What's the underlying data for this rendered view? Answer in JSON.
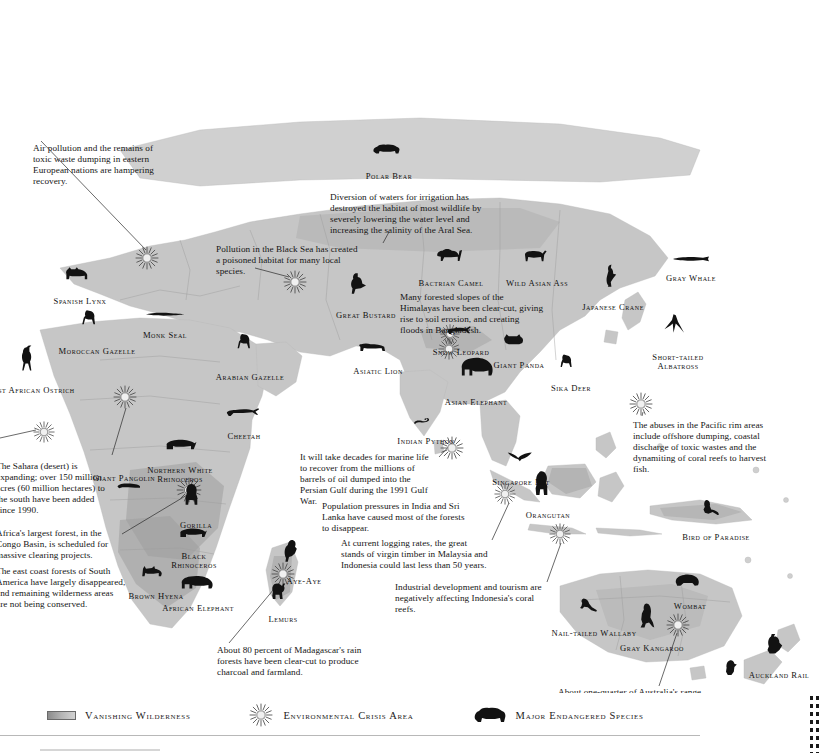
{
  "legend": {
    "items": [
      {
        "id": "vanishing-wilderness",
        "label": "Vanishing  Wilderness",
        "icon": "gradient-band-swatch"
      },
      {
        "id": "environmental-crisis-area",
        "label": "Environmental Crisis Area",
        "icon": "sunburst-icon"
      },
      {
        "id": "major-endangered-species",
        "label": "Major Endangered Species",
        "icon": "bear-silhouette-icon"
      }
    ]
  },
  "colors": {
    "land": "#c9c9c9",
    "land_dark": "#a8a8a8",
    "wilderness_shade": "#9a9a9a",
    "ocean": "#ffffff",
    "ink": "#111111",
    "border_line": "#b0b0b0"
  },
  "annotations": [
    {
      "id": "eastern-europe-pollution",
      "text": "Air pollution and the remains of toxic waste dumping in eastern European nations are hampering recovery.",
      "x": 33,
      "y": 143,
      "w": 140
    },
    {
      "id": "aral-sea",
      "text": "Diversion of waters for irrigation has destroyed the habitat of most wildlife by severely lowering the water level and increasing the salinity of the Aral Sea.",
      "x": 330,
      "y": 192,
      "w": 152
    },
    {
      "id": "black-sea",
      "text": "Pollution in the Black Sea has created a poisoned habitat for many local species.",
      "x": 216,
      "y": 244,
      "w": 148
    },
    {
      "id": "himalayas",
      "text": "Many forested slopes of the Himalayas have been clear-cut, giving rise to soil erosion, and creating floods in Bangladesh.",
      "x": 400,
      "y": 292,
      "w": 145
    },
    {
      "id": "sahara-expansion",
      "text": "The Sahara (desert) is expanding; over 150 million acres (60 million hectares) to the south have been added since 1990.",
      "x": -4,
      "y": 461,
      "w": 118
    },
    {
      "id": "congo-basin",
      "text": "Africa's largest forest, in the Congo Basin, is scheduled for massive clearing projects.",
      "x": -4,
      "y": 528,
      "w": 125
    },
    {
      "id": "south-america-east-coast",
      "text": "The east coast forests of South America have largely disappeared, and remaining wilderness areas are not being conserved.",
      "x": -4,
      "y": 566,
      "w": 130
    },
    {
      "id": "persian-gulf-oil",
      "text": "It will take decades for marine life to recover from the millions of barrels of oil dumped into the Persian Gulf during the 1991 Gulf War.",
      "x": 300,
      "y": 452,
      "w": 138
    },
    {
      "id": "india-sri-lanka",
      "text": "Population pressures in India and Sri Lanka have caused most of the forests to disappear.",
      "x": 322,
      "y": 501,
      "w": 146
    },
    {
      "id": "malaysia-indonesia-timber",
      "text": "At current logging rates, the great stands of virgin timber in Malaysia and Indonesia could last less than 50 years.",
      "x": 341,
      "y": 538,
      "w": 150
    },
    {
      "id": "indonesia-coral-reefs",
      "text": "Industrial development and tourism are negatively affecting Indonesia's coral reefs.",
      "x": 395,
      "y": 582,
      "w": 152
    },
    {
      "id": "pacific-rim-abuses",
      "text": "The abuses in the Pacific rim areas include offshore dumping, coastal discharge of toxic wastes and the dynamiting of coral reefs to harvest fish.",
      "x": 633,
      "y": 420,
      "w": 144
    },
    {
      "id": "madagascar-rainforest",
      "text": "About 80 percent of Madagascar's rain forests have been clear-cut to produce charcoal and farmland.",
      "x": 217,
      "y": 645,
      "w": 152
    },
    {
      "id": "australia-desertification",
      "text": "About one-quarter of Australia's range and cropland has become irreversible desert.",
      "x": 558,
      "y": 687,
      "w": 150
    }
  ],
  "species": [
    {
      "id": "polar-bear",
      "label": "Polar Bear",
      "icon": "bear-icon",
      "lx": 389,
      "ly": 172,
      "ax": 389,
      "ay": 152,
      "aw": 34,
      "ah": 17
    },
    {
      "id": "spanish-lynx",
      "label": "Spanish Lynx",
      "icon": "lynx-icon",
      "lx": 80,
      "ly": 297,
      "ax": 80,
      "ay": 276,
      "aw": 32,
      "ah": 19
    },
    {
      "id": "moroccan-gazelle",
      "label": "Moroccan Gazelle",
      "icon": "gazelle-icon",
      "lx": 97,
      "ly": 347,
      "ax": 92,
      "ay": 320,
      "aw": 30,
      "ah": 25
    },
    {
      "id": "monk-seal",
      "label": "Monk Seal",
      "icon": "seal-icon",
      "lx": 165,
      "ly": 331,
      "ax": 165,
      "ay": 317,
      "aw": 40,
      "ah": 11
    },
    {
      "id": "west-african-ostrich",
      "label": "West African Ostrich",
      "icon": "ostrich-icon",
      "lx": 30,
      "ly": 386,
      "ax": 32,
      "ay": 358,
      "aw": 26,
      "ah": 27
    },
    {
      "id": "arabian-gazelle",
      "label": "Arabian Gazelle",
      "icon": "gazelle-icon",
      "lx": 250,
      "ly": 373,
      "ax": 247,
      "ay": 344,
      "aw": 29,
      "ah": 26
    },
    {
      "id": "great-bustard",
      "label": "Great Bustard",
      "icon": "bustard-icon",
      "lx": 366,
      "ly": 311,
      "ax": 363,
      "ay": 284,
      "aw": 30,
      "ah": 25
    },
    {
      "id": "bactrian-camel",
      "label": "Bactrian Camel",
      "icon": "camel-icon",
      "lx": 451,
      "ly": 279,
      "ax": 451,
      "ay": 257,
      "aw": 34,
      "ah": 20
    },
    {
      "id": "wild-asian-ass",
      "label": "Wild Asian Ass",
      "icon": "ass-icon",
      "lx": 537,
      "ly": 279,
      "ax": 537,
      "ay": 258,
      "aw": 32,
      "ah": 19
    },
    {
      "id": "japanese-crane",
      "label": "Japanese Crane",
      "icon": "crane-icon",
      "lx": 613,
      "ly": 303,
      "ax": 615,
      "ay": 276,
      "aw": 24,
      "ah": 25
    },
    {
      "id": "gray-whale",
      "label": "Gray Whale",
      "icon": "whale-icon",
      "lx": 691,
      "ly": 274,
      "ax": 691,
      "ay": 262,
      "aw": 40,
      "ah": 12
    },
    {
      "id": "short-tailed-albatross",
      "label": "Short-tailed Albatross",
      "icon": "albatross-icon",
      "lx": 678,
      "ly": 353,
      "ax": 678,
      "ay": 325,
      "aw": 30,
      "ah": 25,
      "two_line": true
    },
    {
      "id": "asiatic-lion",
      "label": "Asiatic Lion",
      "icon": "lion-icon",
      "lx": 378,
      "ly": 367,
      "ax": 374,
      "ay": 350,
      "aw": 34,
      "ah": 16
    },
    {
      "id": "snow-leopard",
      "label": "Snow Leopard",
      "icon": "leopard-icon",
      "lx": 461,
      "ly": 348,
      "ax": 462,
      "ay": 333,
      "aw": 32,
      "ah": 16,
      "two_line": true
    },
    {
      "id": "giant-panda",
      "label": "Giant Panda",
      "icon": "panda-icon",
      "lx": 519,
      "ly": 361,
      "ax": 517,
      "ay": 342,
      "aw": 30,
      "ah": 18
    },
    {
      "id": "sika-deer",
      "label": "Sika Deer",
      "icon": "deer-icon",
      "lx": 571,
      "ly": 384,
      "ax": 571,
      "ay": 362,
      "aw": 26,
      "ah": 21
    },
    {
      "id": "asian-elephant",
      "label": "Asian Elephant",
      "icon": "elephant-icon",
      "lx": 476,
      "ly": 398,
      "ax": 478,
      "ay": 369,
      "aw": 38,
      "ah": 27
    },
    {
      "id": "indian-python",
      "label": "Indian Python",
      "icon": "python-icon",
      "lx": 426,
      "ly": 437,
      "ax": 426,
      "ay": 424,
      "aw": 26,
      "ah": 13
    },
    {
      "id": "cheetah",
      "label": "Cheetah",
      "icon": "cheetah-icon",
      "lx": 244,
      "ly": 432,
      "ax": 243,
      "ay": 415,
      "aw": 38,
      "ah": 16
    },
    {
      "id": "giant-pangolin",
      "label": "Giant Pangolin",
      "icon": "pangolin-icon",
      "lx": 124,
      "ly": 474,
      "ax": 132,
      "ay": 488,
      "aw": 32,
      "ah": 14,
      "two_line": true
    },
    {
      "id": "northern-white-rhinoceros",
      "label": "Northern White Rhinoceros",
      "icon": "rhino-icon",
      "lx": 180,
      "ly": 466,
      "ax": 182,
      "ay": 447,
      "aw": 36,
      "ah": 18,
      "two_line": true
    },
    {
      "id": "gorilla",
      "label": "Gorilla",
      "icon": "gorilla-icon",
      "lx": 196,
      "ly": 521,
      "ax": 196,
      "ay": 495,
      "aw": 26,
      "ah": 25
    },
    {
      "id": "black-rhinoceros",
      "label": "Black Rhinoceros",
      "icon": "rhino-icon",
      "lx": 194,
      "ly": 552,
      "ax": 194,
      "ay": 535,
      "aw": 32,
      "ah": 16,
      "two_line": true
    },
    {
      "id": "brown-hyena",
      "label": "Brown Hyena",
      "icon": "hyena-icon",
      "lx": 156,
      "ly": 592,
      "ax": 155,
      "ay": 574,
      "aw": 30,
      "ah": 17
    },
    {
      "id": "african-elephant",
      "label": "African Elephant",
      "icon": "elephant-icon",
      "lx": 198,
      "ly": 604,
      "ax": 198,
      "ay": 584,
      "aw": 38,
      "ah": 19,
      "two_line": true
    },
    {
      "id": "aye-aye",
      "label": "Aye-Aye",
      "icon": "ayeaye-icon",
      "lx": 304,
      "ly": 577,
      "ax": 295,
      "ay": 551,
      "aw": 24,
      "ah": 25
    },
    {
      "id": "lemurs",
      "label": "Lemurs",
      "icon": "lemur-icon",
      "lx": 283,
      "ly": 615,
      "ax": 282,
      "ay": 592,
      "aw": 26,
      "ah": 22
    },
    {
      "id": "singapore-bat",
      "label": "Singapore Bat",
      "icon": "bat-icon",
      "lx": 521,
      "ly": 478,
      "ax": 523,
      "ay": 459,
      "aw": 32,
      "ah": 17
    },
    {
      "id": "orangutan",
      "label": "Orangutan",
      "icon": "orangutan-icon",
      "lx": 548,
      "ly": 511,
      "ax": 546,
      "ay": 483,
      "aw": 26,
      "ah": 26
    },
    {
      "id": "bird-of-paradise",
      "label": "Bird of Paradise",
      "icon": "paradise-icon",
      "lx": 716,
      "ly": 533,
      "ax": 714,
      "ay": 509,
      "aw": 28,
      "ah": 23
    },
    {
      "id": "wombat",
      "label": "Wombat",
      "icon": "wombat-icon",
      "lx": 690,
      "ly": 602,
      "ax": 690,
      "ay": 582,
      "aw": 32,
      "ah": 19
    },
    {
      "id": "nail-tailed-wallaby",
      "label": "Nail-tailed Wallaby",
      "icon": "wallaby-icon",
      "lx": 594,
      "ly": 629,
      "ax": 592,
      "ay": 607,
      "aw": 28,
      "ah": 20
    },
    {
      "id": "gray-kangaroo",
      "label": "Gray Kangaroo",
      "icon": "kangaroo-icon",
      "lx": 652,
      "ly": 644,
      "ax": 651,
      "ay": 615,
      "aw": 26,
      "ah": 27,
      "two_line": true
    },
    {
      "id": "takahe",
      "label": "Takahe",
      "icon": "takahe-icon",
      "lx": 735,
      "ly": 693,
      "ax": 735,
      "ay": 669,
      "aw": 24,
      "ah": 22
    },
    {
      "id": "auckland-rail",
      "label": "Auckland Rail",
      "icon": "rail-icon",
      "lx": 779,
      "ly": 671,
      "ax": 778,
      "ay": 645,
      "aw": 28,
      "ah": 24,
      "two_line": true
    }
  ],
  "crisis_markers": [
    {
      "id": "crisis-eastern-europe",
      "x": 147,
      "y": 258,
      "r": 13
    },
    {
      "id": "crisis-black-sea",
      "x": 295,
      "y": 282,
      "r": 13
    },
    {
      "id": "crisis-aral-sea",
      "x": 450,
      "y": 334,
      "r": 11
    },
    {
      "id": "crisis-himalayas",
      "x": 449,
      "y": 349,
      "r": 12
    },
    {
      "id": "crisis-persian-gulf",
      "x": 452,
      "y": 448,
      "r": 13
    },
    {
      "id": "crisis-sahara",
      "x": 125,
      "y": 397,
      "r": 13
    },
    {
      "id": "crisis-west-africa",
      "x": 44,
      "y": 432,
      "r": 12
    },
    {
      "id": "crisis-congo",
      "x": 189,
      "y": 490,
      "r": 14
    },
    {
      "id": "crisis-madagascar",
      "x": 283,
      "y": 574,
      "r": 13
    },
    {
      "id": "crisis-pacific-rim",
      "x": 641,
      "y": 404,
      "r": 13
    },
    {
      "id": "crisis-singapore",
      "x": 505,
      "y": 494,
      "r": 12
    },
    {
      "id": "crisis-indonesia",
      "x": 560,
      "y": 534,
      "r": 12
    },
    {
      "id": "crisis-australia",
      "x": 678,
      "y": 625,
      "r": 13
    }
  ],
  "leader_lines": [
    {
      "id": "leader-eastern-europe",
      "x1": 41,
      "y1": 141,
      "x2": 146,
      "y2": 250
    },
    {
      "id": "leader-black-sea",
      "x1": 255,
      "y1": 268,
      "x2": 289,
      "y2": 277
    },
    {
      "id": "leader-aral-sea",
      "x1": 389,
      "y1": 232,
      "x2": 383,
      "y2": 243
    },
    {
      "id": "leader-himalayas",
      "x1": 440,
      "y1": 329,
      "x2": 452,
      "y2": 344
    },
    {
      "id": "leader-sahara",
      "x1": 112,
      "y1": 455,
      "x2": 126,
      "y2": 408
    },
    {
      "id": "leader-congo",
      "x1": 122,
      "y1": 534,
      "x2": 187,
      "y2": 495
    },
    {
      "id": "leader-persian-gulf",
      "x1": 439,
      "y1": 457,
      "x2": 452,
      "y2": 443
    },
    {
      "id": "leader-malaysia",
      "x1": 492,
      "y1": 540,
      "x2": 509,
      "y2": 503
    },
    {
      "id": "leader-indonesia",
      "x1": 547,
      "y1": 582,
      "x2": 561,
      "y2": 543
    },
    {
      "id": "leader-pacific-rim",
      "x1": 642,
      "y1": 416,
      "x2": 643,
      "y2": 412
    },
    {
      "id": "leader-madagascar",
      "x1": 229,
      "y1": 643,
      "x2": 279,
      "y2": 583
    },
    {
      "id": "leader-australia",
      "x1": 659,
      "y1": 686,
      "x2": 677,
      "y2": 633
    },
    {
      "id": "leader-south-america",
      "x1": 0,
      "y1": 438,
      "x2": 36,
      "y2": 430
    }
  ]
}
